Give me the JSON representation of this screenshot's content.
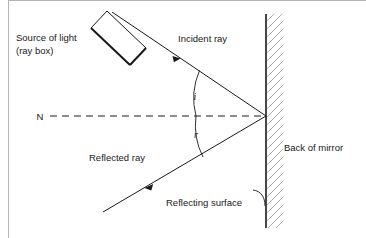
{
  "figure": {
    "width": 366,
    "height": 238,
    "background_color": "#ffffff",
    "ink_color": "#1a1a1a",
    "hatch_color": "#8a8a8a",
    "border_color": "#b5b5b5"
  },
  "labels": {
    "source_line1": "Source of light",
    "source_line2": "(ray box)",
    "incident_ray": "Incident ray",
    "reflected_ray": "Reflected ray",
    "reflecting_surface": "Reflecting surface",
    "back_of_mirror": "Back of mirror",
    "normal": "N",
    "angle_incidence": "i",
    "angle_reflection": "r"
  },
  "geometry": {
    "mirror_x": 266,
    "mirror_top_y": 14,
    "mirror_bottom_y": 228,
    "incidence_point_x": 266,
    "incidence_point_y": 116,
    "incident_start_x": 112,
    "incident_start_y": 12,
    "reflected_end_x": 103,
    "reflected_end_y": 212,
    "normal_start_x": 50,
    "normal_end_x": 266,
    "normal_y": 116
  }
}
